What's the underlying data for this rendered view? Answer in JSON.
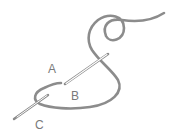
{
  "diagram": {
    "labels": [
      {
        "text": "A",
        "x": 50,
        "y": 73
      },
      {
        "text": "B",
        "x": 71,
        "y": 100
      },
      {
        "text": "C",
        "x": 35,
        "y": 128
      }
    ],
    "colors": {
      "thread": "#8c8c8c",
      "needle_outline": "#8a8a8a",
      "needle_fill": "#ffffff",
      "label": "#7a7a7a",
      "background": "#ffffff"
    }
  }
}
